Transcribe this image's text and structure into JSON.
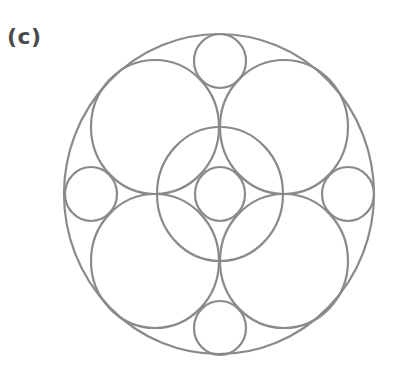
{
  "figure": {
    "label": "(c)",
    "stroke_color": "#8a8a8a",
    "label_color": "#4a4a4a",
    "circles": [
      {
        "name": "outer-circle",
        "cx": 219,
        "cy": 194,
        "rx": 155,
        "ry": 160
      },
      {
        "name": "large-circle-upper-left",
        "cx": 155,
        "cy": 127,
        "rx": 64,
        "ry": 67
      },
      {
        "name": "large-circle-upper-right",
        "cx": 284,
        "cy": 127,
        "rx": 64,
        "ry": 67
      },
      {
        "name": "large-circle-lower-left",
        "cx": 155,
        "cy": 261,
        "rx": 64,
        "ry": 67
      },
      {
        "name": "large-circle-lower-right",
        "cx": 284,
        "cy": 261,
        "rx": 64,
        "ry": 67
      },
      {
        "name": "middle-circle",
        "cx": 220,
        "cy": 194,
        "rx": 63,
        "ry": 67
      },
      {
        "name": "center-small-circle",
        "cx": 220,
        "cy": 194,
        "rx": 25,
        "ry": 27
      },
      {
        "name": "small-circle-top",
        "cx": 220,
        "cy": 61,
        "rx": 26,
        "ry": 27
      },
      {
        "name": "small-circle-bottom",
        "cx": 220,
        "cy": 328,
        "rx": 26,
        "ry": 27
      },
      {
        "name": "small-circle-left",
        "cx": 91,
        "cy": 194,
        "rx": 26,
        "ry": 27
      },
      {
        "name": "small-circle-right",
        "cx": 348,
        "cy": 194,
        "rx": 26,
        "ry": 27
      }
    ]
  }
}
